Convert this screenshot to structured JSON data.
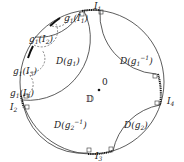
{
  "diagram": {
    "type": "hyperbolic disk with Schottky-type fundamental domain",
    "disk_label": "𝔻",
    "origin_label": "0",
    "colors": {
      "stroke": "#333333",
      "background": "#ffffff"
    },
    "intervals": [
      {
        "id": "I1",
        "text": "I",
        "sub": "1"
      },
      {
        "id": "I2",
        "text": "I",
        "sub": "2"
      },
      {
        "id": "I3",
        "text": "I",
        "sub": "3"
      },
      {
        "id": "I4",
        "text": "I",
        "sub": "4"
      }
    ],
    "images": [
      {
        "id": "g1I1",
        "pre": "g",
        "presub": "1",
        "arg": "I",
        "argsub": "1"
      },
      {
        "id": "g1I2",
        "pre": "g",
        "presub": "1",
        "arg": "I",
        "argsub": "2"
      },
      {
        "id": "g1I3",
        "pre": "g",
        "presub": "1",
        "arg": "I",
        "argsub": "3"
      },
      {
        "id": "g1I4",
        "pre": "g",
        "presub": "1",
        "arg": "I",
        "argsub": "4"
      }
    ],
    "domains": [
      {
        "id": "D_g1",
        "text": "D(g",
        "sub": "1",
        "sup": "",
        "close": ")"
      },
      {
        "id": "D_g1inv",
        "text": "D(g",
        "sub": "1",
        "sup": "−1",
        "close": ")"
      },
      {
        "id": "D_g2inv",
        "text": "D(g",
        "sub": "2",
        "sup": "−1",
        "close": ")"
      },
      {
        "id": "D_g2",
        "text": "D(g",
        "sub": "2",
        "sup": "",
        "close": ")"
      }
    ]
  }
}
